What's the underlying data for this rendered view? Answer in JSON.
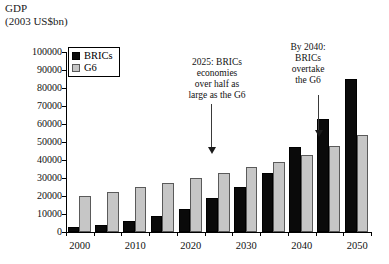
{
  "axis_title": {
    "line1": "GDP",
    "line2": "(2003 US$bn)"
  },
  "legend": {
    "items": [
      {
        "label": "BRICs",
        "color": "#0a0a0a",
        "key": "brics"
      },
      {
        "label": "G6",
        "color": "#c6c6c6",
        "key": "g6"
      }
    ]
  },
  "annotations": [
    {
      "id": "annot-2025",
      "text": "2025: BRICs\neconomies\nover half as\nlarge as the G6"
    },
    {
      "id": "annot-2040",
      "text": "By 2040:\nBRICs\novertake\nthe G6"
    }
  ],
  "chart_data": {
    "type": "bar",
    "title": "GDP (2003 US$bn)",
    "xlabel": "",
    "ylabel": "GDP (2003 US$bn)",
    "ylim": [
      0,
      100000
    ],
    "ytick_step": 10000,
    "ytick_labels": [
      "0",
      "10000",
      "20000",
      "30000",
      "40000",
      "50000",
      "60000",
      "70000",
      "80000",
      "90000",
      "100000"
    ],
    "grid": false,
    "legend_position": "top-left",
    "categories": [
      "2000",
      "2005",
      "2010",
      "2015",
      "2020",
      "2025",
      "2030",
      "2035",
      "2040",
      "2045",
      "2050"
    ],
    "xtick_labels_shown": [
      "2000",
      "",
      "2010",
      "",
      "2020",
      "",
      "2030",
      "",
      "2040",
      "",
      "2050"
    ],
    "series": [
      {
        "name": "BRICs",
        "color": "#0a0a0a",
        "values": [
          3000,
          4000,
          6000,
          9000,
          13000,
          19000,
          25000,
          33000,
          47000,
          63000,
          85000
        ]
      },
      {
        "name": "G6",
        "color": "#c6c6c6",
        "values": [
          20000,
          22000,
          25000,
          27000,
          30000,
          33000,
          36000,
          39000,
          43000,
          48000,
          54000
        ]
      }
    ]
  }
}
